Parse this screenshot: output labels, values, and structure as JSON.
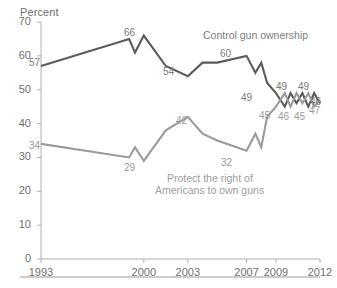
{
  "chart_data": {
    "type": "line",
    "title": "",
    "ylabel": "Percent",
    "xlabel": "",
    "ylim": [
      0,
      70
    ],
    "ytick_labels": [
      "0",
      "10",
      "20",
      "30",
      "40",
      "50",
      "60",
      "70"
    ],
    "ytick_values": [
      0,
      10,
      20,
      30,
      40,
      50,
      60,
      70
    ],
    "xtick_labels": [
      "1993",
      "2000",
      "2003",
      "2007",
      "2009",
      "2012"
    ],
    "xtick_values": [
      1993,
      2000,
      2003,
      2007,
      2009,
      2012
    ],
    "xlim": [
      1993,
      2012
    ],
    "grid": false,
    "legend_position": "inline-annotation",
    "series": [
      {
        "name": "Control gun ownership",
        "color": "#5b5b5b",
        "x": [
          1993,
          1999,
          1999.4,
          2000,
          2001.5,
          2003,
          2004,
          2005,
          2007,
          2007.6,
          2008,
          2008.4,
          2009,
          2009.6,
          2010,
          2010.4,
          2010.8,
          2011.2,
          2011.6,
          2012
        ],
        "values": [
          57,
          65,
          61,
          66,
          57,
          54,
          58,
          58,
          60,
          55,
          58,
          52,
          49,
          45,
          49,
          46,
          49,
          45,
          49,
          46
        ]
      },
      {
        "name": "Protect the right of Americans to own guns",
        "color": "#9a9a9a",
        "x": [
          1993,
          1999,
          1999.4,
          2000,
          2001.5,
          2003,
          2004,
          2005,
          2007,
          2007.6,
          2008,
          2008.4,
          2009,
          2009.6,
          2010,
          2010.4,
          2010.8,
          2011.2,
          2011.6,
          2012
        ],
        "values": [
          34,
          30,
          33,
          29,
          38,
          42,
          37,
          35,
          32,
          37,
          33,
          42,
          45,
          49,
          45,
          49,
          46,
          49,
          45,
          47
        ]
      }
    ],
    "point_labels": [
      {
        "text": "57",
        "series": "Control gun ownership",
        "value": 57,
        "x": 1993,
        "class": "dark",
        "left": 29,
        "top": 57
      },
      {
        "text": "66",
        "series": "Control gun ownership",
        "value": 66,
        "x": 2000,
        "class": "dark",
        "left": 124,
        "top": 27
      },
      {
        "text": "54",
        "series": "Control gun ownership",
        "value": 54,
        "x": 2003,
        "class": "dark",
        "left": 163,
        "top": 66
      },
      {
        "text": "60",
        "series": "Control gun ownership",
        "value": 60,
        "x": 2007,
        "class": "dark",
        "left": 220,
        "top": 48
      },
      {
        "text": "49",
        "series": "Control gun ownership",
        "value": 49,
        "x": 2009,
        "class": "dark",
        "left": 241,
        "top": 92
      },
      {
        "text": "49",
        "series": "Control gun ownership",
        "value": 49,
        "x": 2010,
        "class": "dark",
        "left": 276,
        "top": 81
      },
      {
        "text": "49",
        "series": "Control gun ownership",
        "value": 49,
        "x": 2011.6,
        "class": "dark",
        "left": 298,
        "top": 81
      },
      {
        "text": "46",
        "series": "Control gun ownership",
        "value": 46,
        "x": 2012,
        "class": "dark",
        "left": 310,
        "top": 96
      },
      {
        "text": "34",
        "series": "Protect the right of Americans to own guns",
        "value": 34,
        "x": 1993,
        "class": "light",
        "left": 29,
        "top": 140
      },
      {
        "text": "29",
        "series": "Protect the right of Americans to own guns",
        "value": 29,
        "x": 2000,
        "class": "light",
        "left": 124,
        "top": 162
      },
      {
        "text": "42",
        "series": "Protect the right of Americans to own guns",
        "value": 42,
        "x": 2003,
        "class": "light",
        "left": 176,
        "top": 115
      },
      {
        "text": "32",
        "series": "Protect the right of Americans to own guns",
        "value": 32,
        "x": 2007,
        "class": "light",
        "left": 221,
        "top": 157
      },
      {
        "text": "45",
        "series": "Protect the right of Americans to own guns",
        "value": 45,
        "x": 2009,
        "class": "light",
        "left": 259,
        "top": 110
      },
      {
        "text": "46",
        "series": "Protect the right of Americans to own guns",
        "value": 46,
        "x": 2010.4,
        "class": "light",
        "left": 278,
        "top": 111
      },
      {
        "text": "45",
        "series": "Protect the right of Americans to own guns",
        "value": 45,
        "x": 2011.2,
        "class": "light",
        "left": 294,
        "top": 111
      },
      {
        "text": "47",
        "series": "Protect the right of Americans to own guns",
        "value": 47,
        "x": 2012,
        "class": "light",
        "left": 309,
        "top": 105
      }
    ],
    "annotations": [
      {
        "text": "Control gun ownership",
        "class": "dark",
        "left": 203,
        "top": 29
      },
      {
        "text": "Protect the right of",
        "class": "light",
        "left": 167,
        "top": 172
      },
      {
        "text": "Americans to own guns",
        "class": "light",
        "left": 155,
        "top": 184
      }
    ]
  },
  "colors": {
    "dark_series": "#5b5b5b",
    "light_series": "#9a9a9a",
    "axis": "#b0b0b0",
    "text": "#6f6f6f",
    "background": "#ffffff"
  }
}
